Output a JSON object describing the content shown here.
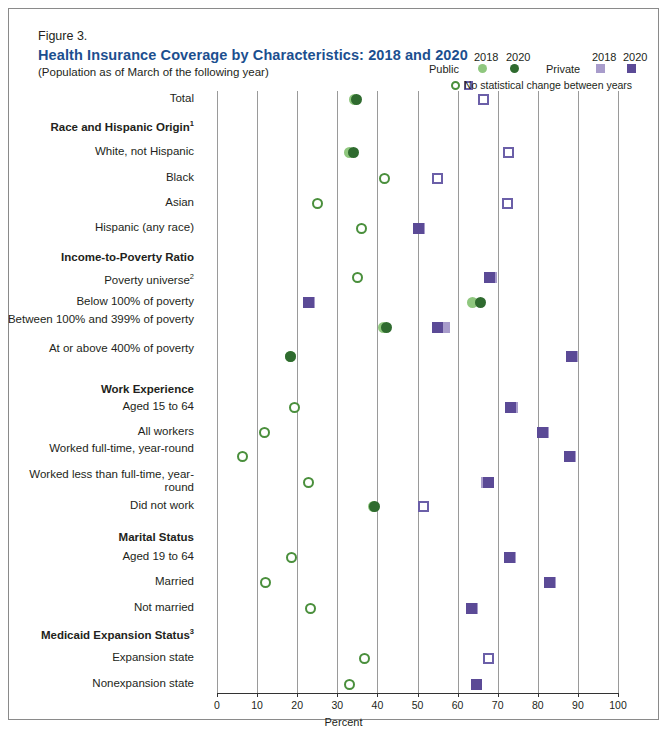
{
  "figure": {
    "label": "Figure 3.",
    "title": "Health Insurance Coverage by Characteristics: 2018 and 2020",
    "subtitle": "(Population as of March of the following year)"
  },
  "legend": {
    "public_label": "Public",
    "private_label": "Private",
    "year_2018": "2018",
    "year_2020": "2020",
    "note": "No statistical change between years",
    "colors": {
      "public_2018": "#8fc77e",
      "public_2020": "#2f6b2f",
      "private_2018": "#a89ccb",
      "private_2020": "#5b4a96"
    }
  },
  "chart_data": {
    "type": "scatter",
    "title": "Health Insurance Coverage by Characteristics: 2018 and 2020",
    "xlabel": "Percent",
    "ylabel": "",
    "xlim": [
      0,
      100
    ],
    "xticks": [
      0,
      10,
      20,
      30,
      40,
      50,
      60,
      70,
      80,
      90,
      100
    ],
    "grid": "vertical",
    "legend_position": "top-right",
    "series": [
      {
        "name": "Public 2018",
        "color": "#8fc77e"
      },
      {
        "name": "Public 2020",
        "color": "#2f6b2f"
      },
      {
        "name": "Private 2018",
        "color": "#a89ccb"
      },
      {
        "name": "Private 2020",
        "color": "#5b4a96"
      }
    ],
    "rows": [
      {
        "label": "Total",
        "type": "item",
        "public_2018": 34.4,
        "public_2020": 34.8,
        "public_nochange": false,
        "private_2018": 67.3,
        "private_2020": 66.5,
        "private_nochange": true
      },
      {
        "label": "Race and Hispanic Origin",
        "sup": "1",
        "type": "group"
      },
      {
        "label": "White, not Hispanic",
        "type": "item",
        "public_2018": 33.1,
        "public_2020": 34.1,
        "public_nochange": false,
        "private_2018": 73.2,
        "private_2020": 72.6,
        "private_nochange": true
      },
      {
        "label": "Black",
        "type": "item",
        "public_2018": 41.3,
        "public_2020": 41.8,
        "public_nochange": true,
        "private_2018": 55.3,
        "private_2020": 55.0,
        "private_nochange": true
      },
      {
        "label": "Asian",
        "type": "item",
        "public_2018": 24.8,
        "public_2020": 25.0,
        "public_nochange": true,
        "private_2018": 72.5,
        "private_2020": 72.5,
        "private_nochange": true
      },
      {
        "label": "Hispanic (any race)",
        "type": "item",
        "public_2018": 35.6,
        "public_2020": 36.0,
        "public_nochange": true,
        "private_2018": 50.5,
        "private_2020": 50.3,
        "private_nochange": false
      },
      {
        "label": "Income-to-Poverty Ratio",
        "type": "group"
      },
      {
        "label": "Poverty universe",
        "sup": "2",
        "type": "item",
        "public_2018": 34.3,
        "public_2020": 35.0,
        "public_nochange": true,
        "private_2018": 68.4,
        "private_2020": 68.0,
        "private_nochange": false
      },
      {
        "label": "Below 100% of poverty",
        "type": "item",
        "public_2018": 63.6,
        "public_2020": 65.6,
        "public_nochange": false,
        "private_2018": 23.1,
        "private_2020": 22.8,
        "private_nochange": false
      },
      {
        "label": "Between 100% and 399% of poverty",
        "type": "item",
        "public_2018": 41.5,
        "public_2020": 42.2,
        "public_nochange": false,
        "private_2018": 56.7,
        "private_2020": 55.0,
        "private_nochange": false
      },
      {
        "label": "At or above 400% of poverty",
        "type": "item",
        "public_2018": 18.3,
        "public_2020": 18.4,
        "public_nochange": false,
        "private_2018": 88.6,
        "private_2020": 88.4,
        "private_nochange": false
      },
      {
        "label": "Work Experience",
        "type": "group"
      },
      {
        "label": "Aged 15 to 64",
        "type": "item",
        "public_2018": 19.0,
        "public_2020": 19.3,
        "public_nochange": true,
        "private_2018": 73.6,
        "private_2020": 73.3,
        "private_nochange": false
      },
      {
        "label": "All workers",
        "type": "item",
        "public_2018": 11.5,
        "public_2020": 11.8,
        "public_nochange": true,
        "private_2018": 81.3,
        "private_2020": 81.1,
        "private_nochange": false
      },
      {
        "label": "Worked full-time, year-round",
        "type": "item",
        "public_2018": 6.0,
        "public_2020": 6.3,
        "public_nochange": true,
        "private_2018": 88.1,
        "private_2020": 87.9,
        "private_nochange": false
      },
      {
        "label": "Worked less than full-time, year-round",
        "type": "item",
        "public_2018": 22.4,
        "public_2020": 22.8,
        "public_nochange": true,
        "private_2018": 67.3,
        "private_2020": 67.8,
        "private_nochange": false
      },
      {
        "label": "Did not work",
        "type": "item",
        "public_2018": 39.0,
        "public_2020": 39.4,
        "public_nochange": false,
        "private_2018": 51.8,
        "private_2020": 51.5,
        "private_nochange": true
      },
      {
        "label": "Marital Status",
        "type": "group"
      },
      {
        "label": "Aged 19 to 64",
        "type": "item",
        "public_2018": 18.2,
        "public_2020": 18.5,
        "public_nochange": true,
        "private_2018": 73.2,
        "private_2020": 73.0,
        "private_nochange": false
      },
      {
        "label": "Married",
        "type": "item",
        "public_2018": 11.8,
        "public_2020": 12.0,
        "public_nochange": true,
        "private_2018": 83.1,
        "private_2020": 82.8,
        "private_nochange": false
      },
      {
        "label": "Not married",
        "type": "item",
        "public_2018": 22.9,
        "public_2020": 23.2,
        "public_nochange": true,
        "private_2018": 63.7,
        "private_2020": 63.5,
        "private_nochange": false
      },
      {
        "label": "Medicaid Expansion Status",
        "sup": "3",
        "type": "group"
      },
      {
        "label": "Expansion state",
        "type": "item",
        "public_2018": 36.4,
        "public_2020": 36.9,
        "public_nochange": true,
        "private_2018": 68.0,
        "private_2020": 67.6,
        "private_nochange": true
      },
      {
        "label": "Nonexpansion state",
        "type": "item",
        "public_2018": 32.4,
        "public_2020": 33.1,
        "public_nochange": true,
        "private_2018": 64.8,
        "private_2020": 64.6,
        "private_nochange": false
      }
    ]
  }
}
